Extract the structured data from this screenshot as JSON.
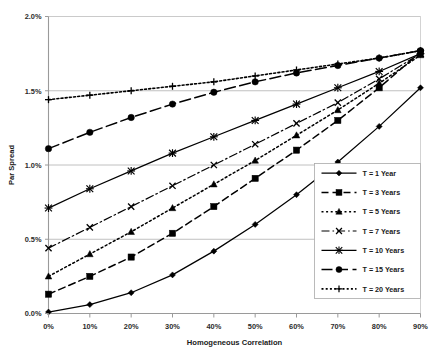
{
  "chart_data": {
    "type": "line",
    "title": "",
    "xlabel": "Homogeneous Correlation",
    "ylabel": "Par Spread",
    "x": [
      0,
      10,
      20,
      30,
      40,
      50,
      60,
      70,
      80,
      90
    ],
    "x_tick_labels": [
      "0%",
      "10%",
      "20%",
      "30%",
      "40%",
      "50%",
      "60%",
      "70%",
      "80%",
      "90%"
    ],
    "y_tick_labels": [
      "0.0%",
      "0.5%",
      "1.0%",
      "1.5%",
      "2.0%"
    ],
    "y_ticks": [
      0.0,
      0.5,
      1.0,
      1.5,
      2.0
    ],
    "xlim": [
      0,
      90
    ],
    "ylim": [
      0.0,
      2.0
    ],
    "grid": "horizontal",
    "legend_position": "inside-bottom-right",
    "series": [
      {
        "name": "T = 1 Year",
        "marker": "diamond",
        "dash": "solid",
        "values": [
          0.01,
          0.06,
          0.14,
          0.26,
          0.42,
          0.6,
          0.8,
          1.02,
          1.26,
          1.52
        ]
      },
      {
        "name": "T = 3 Years",
        "marker": "square",
        "dash": "dashed",
        "values": [
          0.13,
          0.25,
          0.38,
          0.54,
          0.72,
          0.91,
          1.1,
          1.3,
          1.52,
          1.76
        ]
      },
      {
        "name": "T = 5 Years",
        "marker": "triangle",
        "dash": "dotted",
        "values": [
          0.25,
          0.4,
          0.55,
          0.71,
          0.87,
          1.03,
          1.2,
          1.37,
          1.55,
          1.74
        ]
      },
      {
        "name": "T = 7 Years",
        "marker": "cross",
        "dash": "dashdot",
        "values": [
          0.44,
          0.58,
          0.72,
          0.86,
          1.0,
          1.14,
          1.28,
          1.42,
          1.58,
          1.75
        ]
      },
      {
        "name": "T = 10 Years",
        "marker": "asterisk",
        "dash": "solid",
        "values": [
          0.71,
          0.84,
          0.96,
          1.08,
          1.19,
          1.3,
          1.41,
          1.52,
          1.63,
          1.75
        ]
      },
      {
        "name": "T = 15 Years",
        "marker": "circle",
        "dash": "longdash",
        "values": [
          1.11,
          1.22,
          1.32,
          1.41,
          1.49,
          1.56,
          1.62,
          1.67,
          1.72,
          1.77
        ]
      },
      {
        "name": "T = 20 Years",
        "marker": "plus",
        "dash": "fine-dotted",
        "values": [
          1.44,
          1.47,
          1.5,
          1.53,
          1.56,
          1.6,
          1.64,
          1.68,
          1.72,
          1.77
        ]
      }
    ],
    "colors": {
      "line": "#000000",
      "grid": "#b0b0b0",
      "axis": "#a8a8a8",
      "frame": "#c8c8c8",
      "text": "#1a1a1a",
      "background": "#ffffff"
    }
  }
}
